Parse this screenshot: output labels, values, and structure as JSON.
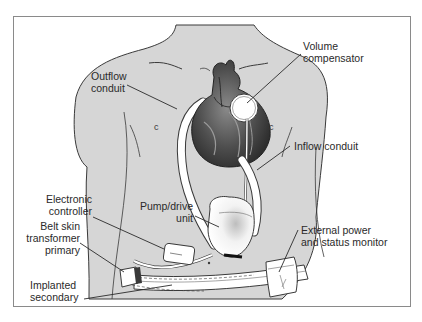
{
  "diagram": {
    "labels": {
      "outflow_conduit": "Outflow\nconduit",
      "volume_compensator": "Volume\ncompensator",
      "inflow_conduit": "Inflow conduit",
      "electronic_controller": "Electronic\ncontroller",
      "pump_drive_unit": "Pump/drive\nunit",
      "belt_skin_transformer_primary": "Belt skin\ntransformer\nprimary",
      "implanted_secondary": "Implanted\nsecondary",
      "external_power_status_monitor": "External power\nand status monitor"
    },
    "colors": {
      "body_fill": "#d6d6d6",
      "outline": "#3a3a3a",
      "device_white": "#ffffff",
      "heart_dark": "#4a4a4a",
      "frame_border": "#8a8a8a"
    }
  }
}
